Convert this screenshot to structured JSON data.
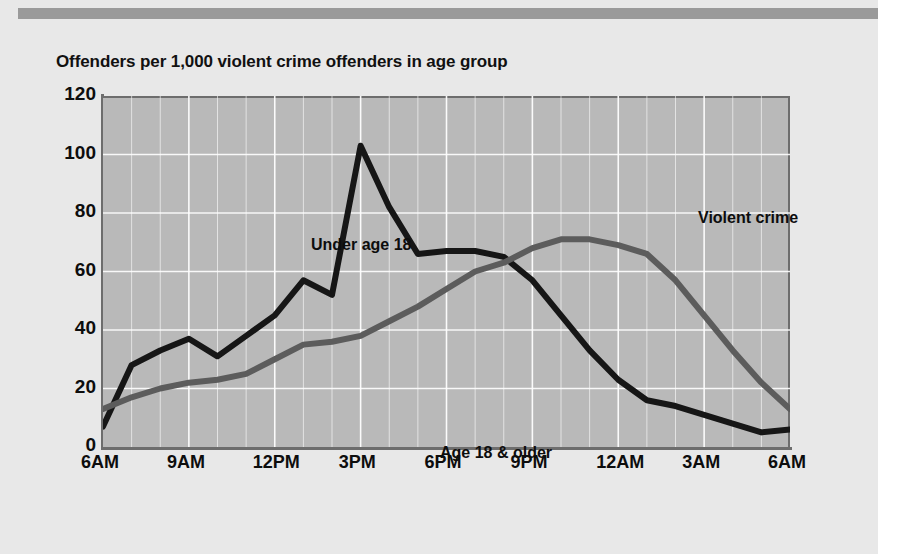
{
  "page": {
    "background_color": "#e8e8e8",
    "rule_color": "#9a9a9a"
  },
  "title": "Offenders per 1,000 violent crime offenders in age group",
  "annotations": {
    "under_18": "Under age 18",
    "age_18_older": "Age 18 & older",
    "crime_type": "Violent crime"
  },
  "axes": {
    "y_ticks": [
      "0",
      "20",
      "40",
      "60",
      "80",
      "100",
      "120"
    ],
    "x_ticks": [
      "6AM",
      "9AM",
      "12PM",
      "3PM",
      "6PM",
      "9PM",
      "12AM",
      "3AM",
      "6AM"
    ]
  },
  "colors": {
    "plot_background": "#b9b9b9",
    "gridline": "#ffffff",
    "axis": "#6d6d6d",
    "under_18_line": "#161616",
    "age_18_older_line": "#5c5c5c",
    "text": "#0d0d0d"
  },
  "chart_data": {
    "type": "line",
    "title": "Offenders per 1,000 violent crime offenders in age group",
    "subtitle": "Violent crime",
    "xlabel": "",
    "ylabel": "Offenders per 1,000 violent crime offenders in age group",
    "xlim": [
      6,
      30
    ],
    "ylim": [
      0,
      120
    ],
    "ytick_step": 20,
    "grid": true,
    "legend_position": "inline-annotations",
    "x": [
      6,
      7,
      8,
      9,
      10,
      11,
      12,
      13,
      14,
      15,
      16,
      17,
      18,
      19,
      20,
      21,
      22,
      23,
      24,
      25,
      26,
      27,
      28,
      29,
      30
    ],
    "x_labels_hourly": [
      "6AM",
      "7AM",
      "8AM",
      "9AM",
      "10AM",
      "11AM",
      "12PM",
      "1PM",
      "2PM",
      "3PM",
      "4PM",
      "5PM",
      "6PM",
      "7PM",
      "8PM",
      "9PM",
      "10PM",
      "11PM",
      "12AM",
      "1AM",
      "2AM",
      "3AM",
      "4AM",
      "5AM",
      "6AM"
    ],
    "series": [
      {
        "name": "Under age 18",
        "color": "#161616",
        "values": [
          7,
          28,
          33,
          37,
          31,
          38,
          45,
          57,
          52,
          103,
          82,
          66,
          67,
          67,
          65,
          57,
          45,
          33,
          23,
          16,
          14,
          11,
          8,
          5,
          6
        ]
      },
      {
        "name": "Age 18 & older",
        "color": "#5c5c5c",
        "values": [
          13,
          17,
          20,
          22,
          23,
          25,
          30,
          35,
          36,
          38,
          43,
          48,
          54,
          60,
          63,
          68,
          71,
          71,
          69,
          66,
          57,
          45,
          33,
          22,
          13
        ]
      }
    ]
  }
}
